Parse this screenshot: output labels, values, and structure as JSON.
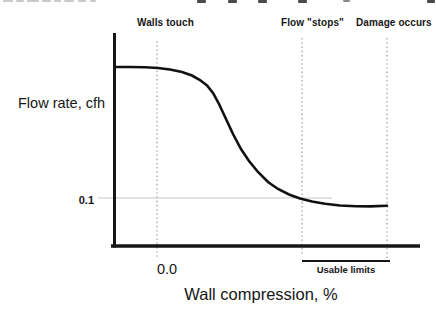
{
  "chart_data": {
    "type": "line",
    "title": "",
    "ylabel": "Flow rate, cfh",
    "xlabel": "Wall compression, %",
    "y_tick_labels": [
      "0.1"
    ],
    "x_tick_labels": [
      "0.0"
    ],
    "legend": "none",
    "markers": [
      {
        "label": "Walls touch",
        "x_px": 157
      },
      {
        "label": "Flow \"stops\"",
        "x_px": 302
      },
      {
        "label": "Damage occurs",
        "x_px": 387
      }
    ],
    "usable_limits": {
      "label": "Usable limits",
      "x1_px": 302,
      "x2_px": 390,
      "y_px": 261
    },
    "y_tick_gridline": {
      "value": "0.1",
      "y_px": 198,
      "x1_px": 98,
      "x2_px": 332
    },
    "curve_points_px": [
      [
        116,
        67
      ],
      [
        130,
        67
      ],
      [
        145,
        67.3
      ],
      [
        158,
        68
      ],
      [
        170,
        69.5
      ],
      [
        182,
        72
      ],
      [
        192,
        75.5
      ],
      [
        200,
        80
      ],
      [
        207,
        85.5
      ],
      [
        213,
        93
      ],
      [
        219,
        104
      ],
      [
        226,
        119
      ],
      [
        233,
        134
      ],
      [
        241,
        149
      ],
      [
        249,
        161
      ],
      [
        258,
        172
      ],
      [
        268,
        182
      ],
      [
        278,
        189
      ],
      [
        289,
        194.5
      ],
      [
        300,
        198.5
      ],
      [
        312,
        201.5
      ],
      [
        325,
        203.8
      ],
      [
        340,
        205.5
      ],
      [
        356,
        206.3
      ],
      [
        370,
        206.4
      ],
      [
        387,
        205.8
      ]
    ]
  },
  "colors": {
    "ink": "#161616",
    "curve": "#111111",
    "dotted_guide": "#9a9a9a",
    "faint_gridline": "#d9d9d9",
    "background": "#ffffff"
  },
  "decorations": {
    "top_cropped_text_marks": [
      [
        3,
        10,
        2,
        "#c9c9c9"
      ],
      [
        16,
        8,
        2,
        "#c9c9c9"
      ],
      [
        27,
        12,
        2,
        "#c9c9c9"
      ],
      [
        42,
        9,
        2,
        "#c9c9c9"
      ],
      [
        54,
        7,
        2,
        "#c9c9c9"
      ],
      [
        64,
        10,
        2,
        "#c9c9c9"
      ],
      [
        78,
        8,
        2,
        "#c9c9c9"
      ],
      [
        90,
        6,
        2,
        "#c9c9c9"
      ],
      [
        197,
        9,
        3,
        "#4a4a4a"
      ],
      [
        228,
        9,
        3,
        "#4a4a4a"
      ],
      [
        258,
        9,
        3,
        "#4a4a4a"
      ],
      [
        298,
        9,
        3,
        "#4a4a4a"
      ],
      [
        343,
        7,
        2,
        "#8a8a8a"
      ],
      [
        427,
        8,
        3,
        "#4a4a4a"
      ]
    ]
  }
}
